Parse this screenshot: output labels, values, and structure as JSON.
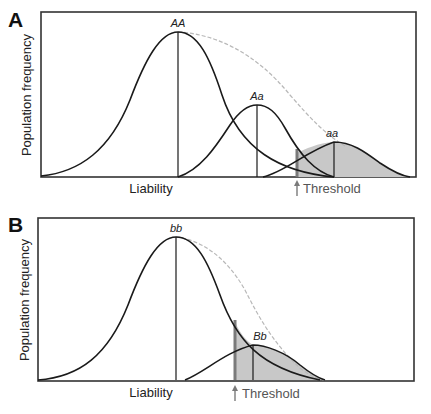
{
  "panels": [
    {
      "letter": "A",
      "ylabel": "Population frequency",
      "xlabel": "Liability",
      "threshold_label": "Threshold",
      "genotypes": [
        {
          "label": "AA",
          "center": 178,
          "height": 145,
          "sigma": 48,
          "from": 41,
          "to": 334
        },
        {
          "label": "Aa",
          "center": 257,
          "height": 72,
          "sigma": 30,
          "from": 178,
          "to": 334
        },
        {
          "label": "aa",
          "center": 334,
          "height": 35,
          "sigma": 30,
          "from": 257,
          "to": 410
        }
      ],
      "threshold_x": 297
    },
    {
      "letter": "B",
      "ylabel": "Population frequency",
      "xlabel": "Liability",
      "threshold_label": "Threshold",
      "genotypes": [
        {
          "label": "bb",
          "center": 176,
          "height": 143,
          "sigma": 48,
          "from": 38,
          "to": 320
        },
        {
          "label": "Bb",
          "center": 253,
          "height": 35,
          "sigma": 26,
          "from": 185,
          "to": 325
        }
      ],
      "threshold_x": 235
    }
  ],
  "colors": {
    "curve": "#1a1a1a",
    "shade": "#c8c8c8",
    "envelope": "#b5b5b5",
    "threshold": "#7a7a7a",
    "frame": "#333333"
  }
}
